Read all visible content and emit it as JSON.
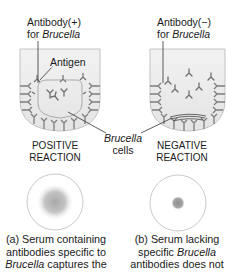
{
  "figure": {
    "panels": [
      {
        "id": "a",
        "antibody_label": {
          "line1": "Antibody(+)",
          "line2_prefix": "for ",
          "line2_italic": "Brucella"
        },
        "antigen_label": "Antigen",
        "reaction_label": {
          "line1": "POSITIVE",
          "line2": "REACTION"
        },
        "caption": {
          "line1": "(a) Serum containing",
          "line2": "antibodies specific to",
          "line3_italic": "Brucella",
          "line3_rest": " captures the"
        },
        "result_pattern": "diffuse-large-spot"
      },
      {
        "id": "b",
        "antibody_label": {
          "line1": "Antibody(−)",
          "line2_prefix": "for ",
          "line2_italic": "Brucella"
        },
        "reaction_label": {
          "line1": "NEGATIVE",
          "line2": "REACTION"
        },
        "caption": {
          "line1": "(b) Serum lacking",
          "line2_prefix": "specific ",
          "line2_italic": "Brucella",
          "line3": "antibodies does not"
        },
        "result_pattern": "small-concentrated-dot"
      }
    ],
    "shared_label": {
      "line1_italic": "Brucella",
      "line2": "cells"
    },
    "colors": {
      "well_fill": "#e9e9e9",
      "well_stroke": "#bdbdbd",
      "antibody": "#8a8a8a",
      "pointer_line": "#333333",
      "circle_stroke": "#c8c8c8",
      "spot": "#a0a0a0"
    }
  }
}
